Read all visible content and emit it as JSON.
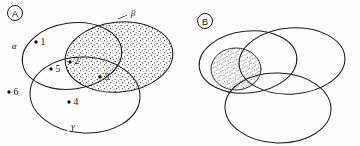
{
  "figure": {
    "background_color": "#fefefe",
    "stroke_color": "#1a1a1a",
    "stipple_color": "#3a3a3a",
    "width": 360,
    "height": 146
  },
  "panels": [
    {
      "id": "panel-a",
      "badge_label": "A",
      "badge_cx": 15,
      "badge_cy": 13,
      "badge_r": 7.5,
      "regions": [
        {
          "name": "alpha",
          "greek_label": "α",
          "label_x": 14,
          "label_y": 46,
          "shaded": false,
          "cx": 72,
          "cy": 56,
          "rx": 50,
          "ry": 33,
          "rotation": -8
        },
        {
          "name": "beta",
          "greek_label": "β",
          "label_x": 133,
          "label_y": 13,
          "shaded": true,
          "cx": 119,
          "cy": 57,
          "rx": 54,
          "ry": 35,
          "rotation": -6
        },
        {
          "name": "gamma",
          "greek_label": "γ",
          "label_x": 73,
          "label_y": 126,
          "shaded": false,
          "cx": 85,
          "cy": 95,
          "rx": 55,
          "ry": 38,
          "rotation": 3
        }
      ],
      "points": [
        {
          "label": "1",
          "x": 42,
          "y": 42
        },
        {
          "label": "2",
          "x": 76,
          "y": 62
        },
        {
          "label": "3",
          "x": 106,
          "y": 77
        },
        {
          "label": "4",
          "x": 75,
          "y": 102
        },
        {
          "label": "5",
          "x": 57,
          "y": 69
        },
        {
          "label": "6",
          "x": 14,
          "y": 92
        }
      ]
    },
    {
      "id": "panel-b",
      "badge_label": "B",
      "badge_cx": 205,
      "badge_cy": 21,
      "badge_r": 7.5,
      "regions": [
        {
          "name": "alpha",
          "greek_label": "",
          "shaded": false,
          "cx": 248,
          "cy": 62,
          "rx": 49,
          "ry": 31,
          "rotation": -6
        },
        {
          "name": "beta",
          "greek_label": "",
          "shaded": false,
          "cx": 292,
          "cy": 61,
          "rx": 53,
          "ry": 33,
          "rotation": -4
        },
        {
          "name": "gamma",
          "greek_label": "",
          "shaded": false,
          "cx": 278,
          "cy": 108,
          "rx": 53,
          "ry": 35,
          "rotation": 2
        }
      ],
      "points": [],
      "shaded_intersection": {
        "name": "alpha-beta-gamma-overlap",
        "cx": 236,
        "cy": 69,
        "rx": 25,
        "ry": 21
      }
    }
  ]
}
